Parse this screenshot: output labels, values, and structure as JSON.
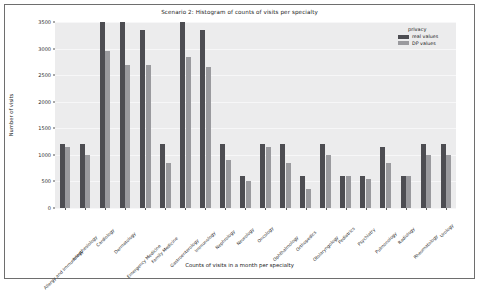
{
  "chart_data": {
    "type": "bar",
    "title": "Scenario 2: Histogram of counts of visits per specialty",
    "xlabel": "Counts of visits in a month per specialty",
    "ylabel": "Number of visits",
    "ylim": [
      0,
      3500
    ],
    "yticks": [
      0,
      500,
      1000,
      1500,
      2000,
      2500,
      3000,
      3500
    ],
    "grid": true,
    "legend_position": "upper right",
    "legend_title": "privacy",
    "categories": [
      "Allergy and Immunology",
      "Anesthesiology",
      "Cardiology",
      "Dermatology",
      "Emergency Medicine",
      "Family Medicine",
      "Gastroenterology",
      "Immunology",
      "Nephrology",
      "Neurology",
      "Oncology",
      "Ophthalmology",
      "Orthopedics",
      "Otolaryngology",
      "Pediatrics",
      "Psychiatry",
      "Pulmonology",
      "Radiology",
      "Rheumatology",
      "Urology"
    ],
    "series": [
      {
        "name": "real values",
        "color": "#4d4d52",
        "values": [
          1200,
          1200,
          3500,
          3500,
          3350,
          1200,
          3500,
          3350,
          1200,
          600,
          1200,
          1200,
          600,
          1200,
          600,
          600,
          1150,
          600,
          1200,
          1200
        ]
      },
      {
        "name": "DP values",
        "color": "#9a9a9e",
        "values": [
          1150,
          1000,
          2950,
          2700,
          2700,
          850,
          2850,
          2650,
          900,
          500,
          1150,
          850,
          350,
          1000,
          600,
          550,
          850,
          600,
          1000,
          1000
        ]
      }
    ]
  },
  "figure": {
    "background": "#ffffff",
    "plot_background": "#ececed",
    "frame_color": "#6e6e6e"
  }
}
